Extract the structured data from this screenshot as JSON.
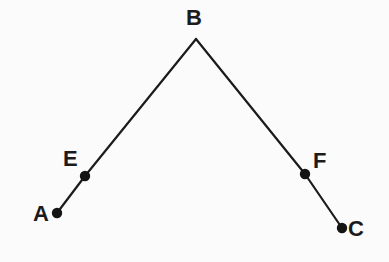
{
  "figure": {
    "background_color": "#fbfbfb",
    "stroke_color": "#1b1b1b",
    "stroke_width": 2.2,
    "point_color": "#141414",
    "point_radius": 5.2,
    "label_color": "#1b1b1b"
  },
  "points": [
    {
      "id": "A",
      "label": "A",
      "x": 57,
      "y": 213,
      "label_x": 33,
      "label_y": 203,
      "marker": true
    },
    {
      "id": "E",
      "label": "E",
      "x": 85,
      "y": 176,
      "label_x": 63,
      "label_y": 148,
      "marker": true
    },
    {
      "id": "B",
      "label": "B",
      "x": 196,
      "y": 39,
      "label_x": 186,
      "label_y": 7,
      "marker": false
    },
    {
      "id": "F",
      "label": "F",
      "x": 305,
      "y": 174,
      "label_x": 313,
      "label_y": 150,
      "marker": true
    },
    {
      "id": "C",
      "label": "C",
      "x": 342,
      "y": 228,
      "label_x": 348,
      "label_y": 218,
      "marker": true
    }
  ],
  "segments": [
    {
      "id": "AB",
      "from": "A",
      "to": "B",
      "path": "57,213 85,176 196,39"
    },
    {
      "id": "BC",
      "from": "B",
      "to": "C",
      "path": "196,39 305,174 342,228"
    }
  ],
  "chart_data": {
    "type": "scatter",
    "xlabel": "",
    "ylabel": "",
    "grid": false,
    "legend": "none",
    "xlim": [
      0,
      389
    ],
    "ylim": [
      262,
      0
    ],
    "labels": [
      "A",
      "E",
      "B",
      "F",
      "C"
    ],
    "x": [
      57,
      85,
      196,
      305,
      342
    ],
    "y": [
      213,
      176,
      39,
      174,
      228
    ],
    "annotations": [
      "A",
      "E",
      "B",
      "F",
      "C"
    ],
    "series": [
      {
        "name": "ray BA",
        "points": [
          [
            196,
            39
          ],
          [
            85,
            176
          ],
          [
            57,
            213
          ]
        ]
      },
      {
        "name": "ray BC",
        "points": [
          [
            196,
            39
          ],
          [
            305,
            174
          ],
          [
            342,
            228
          ]
        ]
      }
    ]
  }
}
